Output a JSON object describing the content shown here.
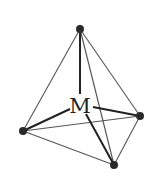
{
  "diagram": {
    "title": "",
    "type": "tetrahedral coordination geometry",
    "center": {
      "label": "M",
      "x": 80,
      "y": 106
    },
    "vertices": [
      {
        "name": "top",
        "x": 80,
        "y": 29
      },
      {
        "name": "left",
        "x": 23,
        "y": 131
      },
      {
        "name": "right",
        "x": 140,
        "y": 116
      },
      {
        "name": "bottom",
        "x": 114,
        "y": 165
      }
    ],
    "edges": [
      [
        "top",
        "left"
      ],
      [
        "top",
        "right"
      ],
      [
        "top",
        "bottom"
      ],
      [
        "left",
        "right"
      ],
      [
        "left",
        "bottom"
      ],
      [
        "right",
        "bottom"
      ]
    ],
    "bonds": [
      [
        "M",
        "top"
      ],
      [
        "M",
        "left"
      ],
      [
        "M",
        "right"
      ],
      [
        "M",
        "bottom"
      ]
    ],
    "colors": {
      "background": "#ffffff",
      "edge": "#555555",
      "bond": "#222222",
      "atom": "#2a2a2a"
    }
  }
}
